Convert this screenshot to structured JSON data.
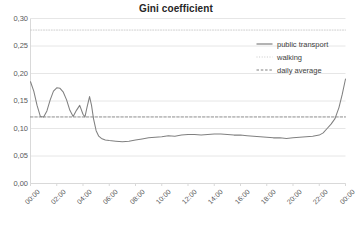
{
  "chart_data": {
    "type": "line",
    "title": "Gini coefficient",
    "xlabel": "",
    "ylabel": "",
    "ylim": [
      0.0,
      0.3
    ],
    "ytick_values": [
      0.3,
      0.25,
      0.2,
      0.15,
      0.1,
      0.05,
      0.0
    ],
    "ytick_labels": [
      "0,30",
      "0,25",
      "0,20",
      "0,15",
      "0,10",
      "0,05",
      "0,00"
    ],
    "xtick_labels": [
      "00:00",
      "02:00",
      "04:00",
      "06:00",
      "08:00",
      "10:00",
      "12:00",
      "14:00",
      "16:00",
      "18:00",
      "20:00",
      "22:00",
      "00:00"
    ],
    "xlim_hours": [
      0,
      24
    ],
    "grid": "horizontal",
    "legend_position": "upper-right",
    "colors": {
      "public_transport": "#808080",
      "walking": "#c8c8c8",
      "daily_average": "#7f7f7f",
      "gridline": "#e6e6e6",
      "axis": "#d9d9d9",
      "text": "#595959",
      "title": "#262626",
      "background": "#ffffff"
    },
    "series": [
      {
        "name": "public transport",
        "style": "solid",
        "color": "#808080",
        "x": [
          0.0,
          0.25,
          0.5,
          0.75,
          1.0,
          1.25,
          1.5,
          1.75,
          2.0,
          2.25,
          2.5,
          2.75,
          3.0,
          3.25,
          3.5,
          3.75,
          4.0,
          4.15,
          4.3,
          4.5,
          4.65,
          4.8,
          5.0,
          5.2,
          5.4,
          5.7,
          6.0,
          6.5,
          7.0,
          7.5,
          8.0,
          8.5,
          9.0,
          9.5,
          10.0,
          10.5,
          11.0,
          11.5,
          12.0,
          12.5,
          13.0,
          13.5,
          14.0,
          14.5,
          15.0,
          15.5,
          16.0,
          16.5,
          17.0,
          17.5,
          18.0,
          18.5,
          19.0,
          19.5,
          20.0,
          20.5,
          21.0,
          21.5,
          22.0,
          22.3,
          22.6,
          22.9,
          23.2,
          23.5,
          23.75,
          24.0
        ],
        "y": [
          0.185,
          0.168,
          0.142,
          0.122,
          0.121,
          0.132,
          0.152,
          0.168,
          0.174,
          0.173,
          0.166,
          0.152,
          0.133,
          0.122,
          0.133,
          0.142,
          0.126,
          0.121,
          0.138,
          0.158,
          0.142,
          0.118,
          0.096,
          0.086,
          0.082,
          0.079,
          0.078,
          0.077,
          0.076,
          0.077,
          0.079,
          0.081,
          0.083,
          0.084,
          0.085,
          0.087,
          0.086,
          0.088,
          0.089,
          0.089,
          0.088,
          0.089,
          0.09,
          0.09,
          0.089,
          0.088,
          0.088,
          0.087,
          0.086,
          0.085,
          0.084,
          0.083,
          0.083,
          0.082,
          0.083,
          0.084,
          0.085,
          0.086,
          0.088,
          0.092,
          0.1,
          0.108,
          0.118,
          0.138,
          0.162,
          0.19
        ]
      },
      {
        "name": "walking",
        "style": "dotted",
        "color": "#c8c8c8",
        "x": [
          0.0,
          24.0
        ],
        "y": [
          0.279,
          0.279
        ]
      },
      {
        "name": "daily average",
        "style": "dashed",
        "color": "#7f7f7f",
        "x": [
          0.0,
          24.0
        ],
        "y": [
          0.121,
          0.121
        ]
      }
    ]
  },
  "legend": {
    "items": [
      {
        "label": "public transport",
        "style": "solid"
      },
      {
        "label": "walking",
        "style": "dotted"
      },
      {
        "label": "daily average",
        "style": "dashed"
      }
    ]
  }
}
